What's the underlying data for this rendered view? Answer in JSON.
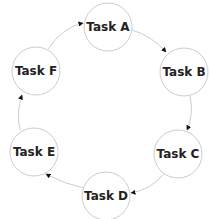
{
  "diagram": {
    "type": "cycle",
    "nodes": [
      {
        "id": "A",
        "label": "Task A",
        "cx": 108,
        "cy": 27
      },
      {
        "id": "B",
        "label": "Task B",
        "cx": 184,
        "cy": 72
      },
      {
        "id": "C",
        "label": "Task C",
        "cx": 178,
        "cy": 154
      },
      {
        "id": "D",
        "label": "Task D",
        "cx": 106,
        "cy": 196
      },
      {
        "id": "E",
        "label": "Task E",
        "cx": 34,
        "cy": 152
      },
      {
        "id": "F",
        "label": "Task F",
        "cx": 36,
        "cy": 71
      }
    ],
    "edges": [
      {
        "from": "A",
        "to": "B"
      },
      {
        "from": "B",
        "to": "C"
      },
      {
        "from": "C",
        "to": "D"
      },
      {
        "from": "D",
        "to": "E"
      },
      {
        "from": "E",
        "to": "F"
      },
      {
        "from": "F",
        "to": "A"
      }
    ],
    "colors": {
      "node_stroke": "#cccccc",
      "edge_stroke": "#cccccc",
      "arrowhead": "#111111",
      "text": "#222222",
      "background": "#ffffff"
    }
  }
}
